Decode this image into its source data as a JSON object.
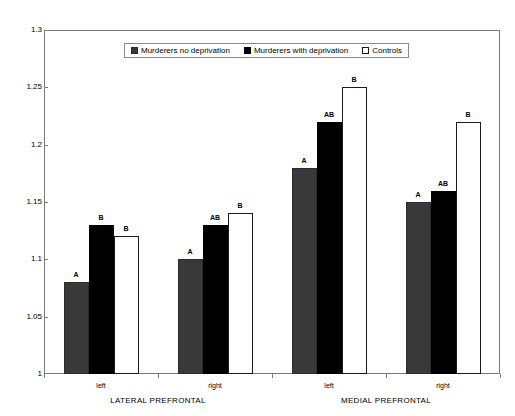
{
  "chart_data": {
    "type": "bar",
    "title": "",
    "subtitle": "",
    "xlabel": "",
    "ylabel": "",
    "ylim": [
      1,
      1.3
    ],
    "ytick_step": 0.05,
    "ytick_labels": [
      "1.3",
      "1.25",
      "1.2",
      "1.15",
      "1.1",
      "1.05",
      "1"
    ],
    "ytick_values": [
      1.3,
      1.25,
      1.2,
      1.15,
      1.1,
      1.05,
      1.0
    ],
    "grid": false,
    "legend_position": "top-center",
    "categories": [
      "left",
      "right",
      "left",
      "right"
    ],
    "group_labels": [
      "LATERAL PREFRONTAL",
      "MEDIAL PREFRONTAL"
    ],
    "series": [
      {
        "name": "Murderers no deprivation",
        "color": "#393939",
        "values": [
          1.08,
          1.1,
          1.18,
          1.15
        ],
        "annotations": [
          "A",
          "A",
          "A",
          "A"
        ]
      },
      {
        "name": "Murderers with deprivation",
        "color": "#000000",
        "values": [
          1.13,
          1.13,
          1.22,
          1.16
        ],
        "annotations": [
          "B",
          "AB",
          "AB",
          "AB"
        ]
      },
      {
        "name": "Controls",
        "color": "#ffffff",
        "values": [
          1.12,
          1.14,
          1.25,
          1.22
        ],
        "annotations": [
          "B",
          "B",
          "B",
          "B"
        ]
      }
    ]
  },
  "legend": {
    "entries": [
      {
        "label": "Murderers no deprivation"
      },
      {
        "label": "Murderers with deprivation"
      },
      {
        "label": "Controls"
      }
    ]
  },
  "axes": {
    "y_labels": [
      "1.3",
      "1.25",
      "1.2",
      "1.15",
      "1.1",
      "1.05",
      "1"
    ],
    "x_sub_labels": [
      "left",
      "right",
      "left",
      "right"
    ],
    "x_group_labels": [
      "LATERAL PREFRONTAL",
      "MEDIAL PREFRONTAL"
    ]
  }
}
